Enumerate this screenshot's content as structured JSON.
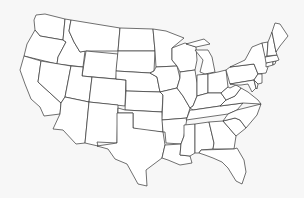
{
  "map": {
    "title": "United States outline map",
    "background_color": "#f7f7f7",
    "fill_color": "#ffffff",
    "stroke_color": "#333333",
    "states": [
      {
        "id": "WA",
        "d": "M36,15 L45,14 L65,19 L63,40 L40,36 L35,30 L34,20 Z"
      },
      {
        "id": "OR",
        "d": "M35,30 L40,36 L63,40 L66,42 L58,57 L57,64 L24,56 L27,44 Z"
      },
      {
        "id": "CA",
        "d": "M24,56 L41,61 L38,82 L61,103 L60,114 L44,116 L40,107 L31,99 L25,84 L20,70 Z"
      },
      {
        "id": "ID",
        "d": "M65,19 L71,20 L69,31 L74,42 L80,52 L85,51 L83,67 L57,64 L58,57 L66,42 L63,40 Z"
      },
      {
        "id": "NV",
        "d": "M41,61 L71,66 L65,97 L61,103 L38,82 Z"
      },
      {
        "id": "MT",
        "d": "M71,20 L120,28 L118,51 L86,51 L80,52 L74,42 L69,31 Z"
      },
      {
        "id": "WY",
        "d": "M86,51 L118,54 L116,79 L82,76 Z"
      },
      {
        "id": "UT",
        "d": "M71,66 L83,67 L82,76 L92,77 L89,102 L65,97 Z"
      },
      {
        "id": "AZ",
        "d": "M65,97 L89,102 L85,143 L76,144 L63,130 L53,129 L60,114 L61,103 Z"
      },
      {
        "id": "CO",
        "d": "M92,77 L126,80 L125,106 L89,102 Z"
      },
      {
        "id": "NM",
        "d": "M89,102 L118,105 L117,143 L97,142 L98,146 L85,143 Z"
      },
      {
        "id": "ND",
        "d": "M120,28 L153,29 L155,51 L118,51 Z"
      },
      {
        "id": "SD",
        "d": "M118,51 L155,51 L154,71 L150,73 L116,71 Z"
      },
      {
        "id": "NE",
        "d": "M116,71 L150,73 L157,77 L160,92 L126,91 L126,80 L116,79 Z"
      },
      {
        "id": "KS",
        "d": "M126,91 L160,92 L163,95 L162,112 L125,110 Z"
      },
      {
        "id": "OK",
        "d": "M118,108 L125,110 L162,112 L163,132 L140,130 L133,128 L133,113 L118,113 Z"
      },
      {
        "id": "TX",
        "d": "M117,113 L133,113 L133,128 L163,132 L165,145 L162,158 L146,170 L147,186 L138,184 L127,164 L115,159 L108,149 L97,146 L117,143 Z"
      },
      {
        "id": "MN",
        "d": "M153,29 L166,31 L184,38 L172,48 L172,60 L177,66 L156,67 L155,51 Z"
      },
      {
        "id": "IA",
        "d": "M154,71 L156,67 L177,66 L180,78 L177,88 L160,92 L157,77 L150,73 Z"
      },
      {
        "id": "MO",
        "d": "M160,92 L177,88 L183,96 L190,108 L187,118 L162,120 L163,95 Z"
      },
      {
        "id": "AR",
        "d": "M162,120 L187,118 L184,136 L181,144 L166,143 L165,132 L163,132 Z"
      },
      {
        "id": "LA",
        "d": "M165,145 L181,144 L180,155 L190,156 L192,163 L180,165 L168,160 L162,158 Z"
      },
      {
        "id": "WI",
        "d": "M172,48 L185,43 L196,47 L197,60 L195,70 L180,72 L177,66 L172,60 Z"
      },
      {
        "id": "IL",
        "d": "M180,72 L195,70 L197,83 L197,96 L193,106 L190,108 L183,96 L177,88 L180,78 Z"
      },
      {
        "id": "MI",
        "d": "M195,50 L208,50 L212,57 L215,72 L205,74 L200,72 L203,60 Z M186,44 L204,39 L210,44 L196,47 Z"
      },
      {
        "id": "IN",
        "d": "M197,75 L208,74 L208,93 L197,96 Z"
      },
      {
        "id": "OH",
        "d": "M208,74 L218,72 L226,70 L228,87 L221,93 L208,93 Z"
      },
      {
        "id": "KY",
        "d": "M190,108 L193,106 L197,96 L208,93 L221,93 L226,100 L220,106 L193,110 Z"
      },
      {
        "id": "TN",
        "d": "M187,118 L190,110 L193,110 L220,106 L243,103 L237,110 L228,114 L186,120 Z"
      },
      {
        "id": "MS",
        "d": "M184,125 L195,124 L195,153 L190,156 L180,155 L181,144 L184,136 Z"
      },
      {
        "id": "AL",
        "d": "M195,124 L209,122 L214,143 L213,149 L201,150 L199,153 L195,153 Z"
      },
      {
        "id": "GA",
        "d": "M209,122 L223,121 L236,136 L234,149 L213,149 L214,143 Z"
      },
      {
        "id": "FL",
        "d": "M199,153 L201,150 L234,149 L237,148 L244,160 L246,172 L242,184 L236,181 L228,168 L222,162 L213,158 L205,155 Z"
      },
      {
        "id": "SC",
        "d": "M223,121 L235,118 L240,120 L246,128 L236,136 Z"
      },
      {
        "id": "NC",
        "d": "M228,114 L237,110 L261,104 L257,115 L246,128 L240,120 L235,118 L223,121 Z"
      },
      {
        "id": "VA",
        "d": "M220,106 L226,100 L235,96 L241,88 L248,92 L258,100 L261,104 L243,103 Z"
      },
      {
        "id": "WV",
        "d": "M221,93 L228,87 L230,88 L236,85 L241,88 L235,96 L226,100 Z"
      },
      {
        "id": "PA",
        "d": "M226,70 L230,67 L254,64 L258,74 L254,80 L230,84 Z"
      },
      {
        "id": "NY",
        "d": "M230,67 L245,60 L252,47 L262,43 L266,57 L268,67 L266,73 L258,74 L254,64 Z"
      },
      {
        "id": "MD",
        "d": "M230,84 L254,80 L256,88 L252,92 L248,84 L241,85 L236,85 Z"
      },
      {
        "id": "DE",
        "d": "M254,80 L258,84 L257,89 L256,88 Z"
      },
      {
        "id": "NJ",
        "d": "M258,74 L262,74 L262,83 L258,84 L254,80 Z"
      },
      {
        "id": "CT",
        "d": "M266,63 L273,61 L273,65 L266,67 Z"
      },
      {
        "id": "RI",
        "d": "M273,61 L276,61 L275,64 L273,65 Z"
      },
      {
        "id": "MA",
        "d": "M265,57 L277,55 L279,60 L276,61 L266,63 Z"
      },
      {
        "id": "VT",
        "d": "M262,43 L268,42 L267,56 L265,57 Z"
      },
      {
        "id": "NH",
        "d": "M268,42 L272,32 L276,52 L277,55 L267,56 Z"
      },
      {
        "id": "ME",
        "d": "M272,32 L275,23 L280,24 L288,36 L280,46 L276,52 Z"
      }
    ]
  }
}
